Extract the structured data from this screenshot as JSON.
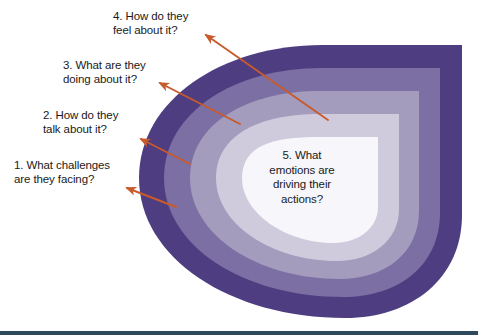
{
  "diagram": {
    "type": "concentric-teardrop-layers",
    "title_visible": false,
    "colors": {
      "band_1_outer": "#4e3d80",
      "band_2": "#7b6fa3",
      "band_3": "#a39cbd",
      "band_4": "#cfcbdd",
      "band_5_center": "#f7f6fa",
      "arrow": "#c85a2c",
      "text": "#1a1a1a",
      "bottom_rule": "#2d4a5c",
      "background": "#ffffff"
    },
    "callouts": [
      {
        "id": "callout-4",
        "number": "4.",
        "text": "4. How do they\nfeel about it?",
        "align": "left",
        "x": 113,
        "y": 9,
        "width": 104,
        "arrow": {
          "x1": 328,
          "y1": 120,
          "x2": 203,
          "y2": 33
        }
      },
      {
        "id": "callout-3",
        "number": "3.",
        "text": "3. What are they\ndoing about it?",
        "align": "left",
        "x": 63,
        "y": 58,
        "width": 110,
        "arrow": {
          "x1": 240,
          "y1": 124,
          "x2": 157,
          "y2": 81
        }
      },
      {
        "id": "callout-2",
        "number": "2.",
        "text": "2. How do they\ntalk about it?",
        "align": "left",
        "x": 43,
        "y": 108,
        "width": 100,
        "arrow": {
          "x1": 190,
          "y1": 164,
          "x2": 138,
          "y2": 137
        }
      },
      {
        "id": "callout-1",
        "number": "1.",
        "text": "1. What challenges\nare they facing?",
        "align": "left",
        "x": 14,
        "y": 158,
        "width": 124,
        "arrow": {
          "x1": 176,
          "y1": 207,
          "x2": 124,
          "y2": 186
        }
      }
    ],
    "center": {
      "id": "callout-5",
      "number": "5.",
      "text": "5. What\nemotions are\ndriving their\nactions?"
    },
    "bands": [
      {
        "index": 1,
        "label": "outer band",
        "color": "#4e3d80"
      },
      {
        "index": 2,
        "label": "second band",
        "color": "#7b6fa3"
      },
      {
        "index": 3,
        "label": "third band",
        "color": "#a39cbd"
      },
      {
        "index": 4,
        "label": "fourth band",
        "color": "#cfcbdd"
      },
      {
        "index": 5,
        "label": "center core",
        "color": "#f7f6fa"
      }
    ],
    "burst": {
      "id": "starburst",
      "color": "#4e3d80",
      "description": "jagged explosion spikes at lower-left of outer band"
    }
  }
}
